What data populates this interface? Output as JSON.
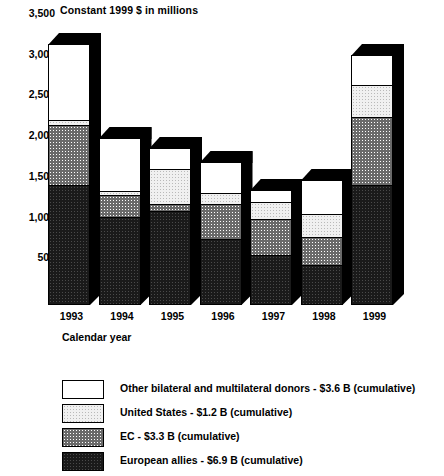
{
  "chart_data": {
    "type": "bar",
    "subtype": "stacked-bar-3d",
    "title": "Constant 1999 $ in millions",
    "xlabel": "Calendar year",
    "ylabel": "",
    "ylim": [
      0,
      3500
    ],
    "yticks": [
      0,
      500,
      1000,
      1500,
      2000,
      2500,
      3000,
      3500
    ],
    "ytick_labels": [
      "0",
      "500",
      "1,000",
      "1,500",
      "2,000",
      "2,500",
      "3,000",
      "3,500"
    ],
    "grid": false,
    "legend_position": "below",
    "categories": [
      "1993",
      "1994",
      "1995",
      "1996",
      "1997",
      "1998",
      "1999"
    ],
    "series": [
      {
        "name": "European allies - $6.9 B (cumulative)",
        "short_name": "European allies",
        "cumulative_total": "$6.9 B",
        "fill": "fill-allies",
        "values": [
          1475,
          1080,
          1160,
          810,
          620,
          490,
          1475
        ]
      },
      {
        "name": "EC - $3.3 B (cumulative)",
        "short_name": "EC",
        "cumulative_total": "$3.3 B",
        "fill": "fill-ec",
        "values": [
          740,
          270,
          85,
          430,
          440,
          345,
          835
        ]
      },
      {
        "name": "United States - $1.2 B (cumulative)",
        "short_name": "United States",
        "cumulative_total": "$1.2 B",
        "fill": "fill-us",
        "values": [
          55,
          50,
          430,
          135,
          210,
          285,
          390
        ]
      },
      {
        "name": "Other bilateral and multilateral donors - $3.6 B (cumulative)",
        "short_name": "Other bilateral and multilateral donors",
        "cumulative_total": "$3.6 B",
        "fill": "fill-other",
        "values": [
          935,
          650,
          255,
          380,
          145,
          415,
          370
        ]
      }
    ],
    "totals": [
      3205,
      2050,
      1930,
      1755,
      1415,
      1535,
      3070
    ]
  },
  "legend": {
    "items": [
      {
        "label": "Other bilateral and multilateral donors - $3.6 B (cumulative)",
        "fill": "fill-other"
      },
      {
        "label": "United States - $1.2 B (cumulative)",
        "fill": "fill-us"
      },
      {
        "label": "EC - $3.3 B (cumulative)",
        "fill": "fill-ec"
      },
      {
        "label": "European allies - $6.9 B (cumulative)",
        "fill": "fill-allies"
      }
    ]
  },
  "colors": {
    "ink": "#000000",
    "background": "#ffffff"
  }
}
